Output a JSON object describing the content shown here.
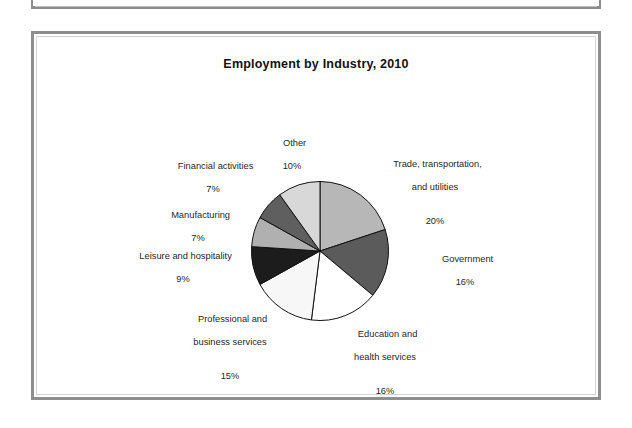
{
  "figure": {
    "title": "Employment by Industry, 2010"
  },
  "chart_data": {
    "type": "pie",
    "title": "Employment by Industry, 2010",
    "xlabel": "",
    "ylabel": "",
    "legend": "none (direct slice labels)",
    "grid": false,
    "start_angle_deg": 90,
    "direction": "clockwise",
    "units": "percent",
    "total": 100,
    "categories": [
      "Trade, transportation,\nand utilities",
      "Government",
      "Education and\nhealth services",
      "Professional and\nbusiness services",
      "Leisure and hospitality",
      "Manufacturing",
      "Financial activities",
      "Other"
    ],
    "values": [
      20,
      16,
      16,
      15,
      9,
      7,
      7,
      10
    ],
    "slices": [
      {
        "name": "Trade, transportation, and utilities",
        "label_line1": "Trade, transportation,",
        "label_line2": "and utilities",
        "value": 20,
        "pct_text": "20%",
        "color": "#b7b7b7"
      },
      {
        "name": "Government",
        "label_line1": "Government",
        "label_line2": "",
        "value": 16,
        "pct_text": "16%",
        "color": "#5b5b5b"
      },
      {
        "name": "Education and health services",
        "label_line1": "Education and",
        "label_line2": "health services",
        "value": 16,
        "pct_text": "16%",
        "color": "#ffffff"
      },
      {
        "name": "Professional and business services",
        "label_line1": "Professional and",
        "label_line2": "business services",
        "value": 15,
        "pct_text": "15%",
        "color": "#f7f7f7"
      },
      {
        "name": "Leisure and hospitality",
        "label_line1": "Leisure and hospitality",
        "label_line2": "",
        "value": 9,
        "pct_text": "9%",
        "color": "#1c1c1c"
      },
      {
        "name": "Manufacturing",
        "label_line1": "Manufacturing",
        "label_line2": "",
        "value": 7,
        "pct_text": "7%",
        "color": "#b0b0b0"
      },
      {
        "name": "Financial activities",
        "label_line1": "Financial activities",
        "label_line2": "",
        "value": 7,
        "pct_text": "7%",
        "color": "#5f5f5f"
      },
      {
        "name": "Other",
        "label_line1": "Other",
        "label_line2": "",
        "value": 10,
        "pct_text": "10%",
        "color": "#d8d8d8"
      }
    ]
  },
  "colors": {
    "frame_outer": "#8f8f8f",
    "frame_inner": "#d2d2d2",
    "page_background": "#ffffff",
    "text": "#1f1f1f",
    "slice_outline": "#111111"
  }
}
